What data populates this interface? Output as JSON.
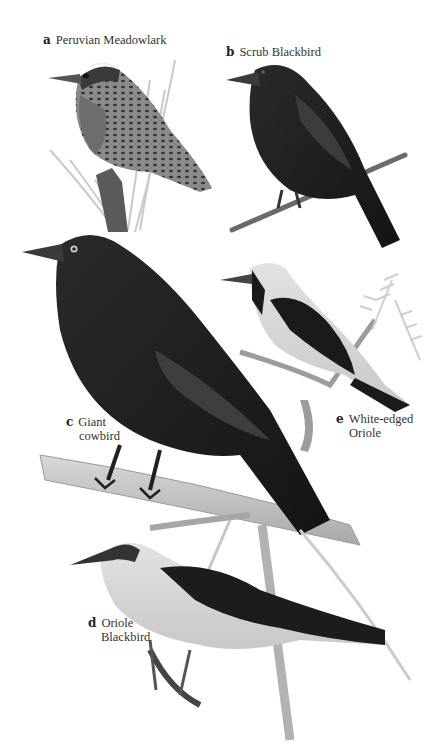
{
  "plate": {
    "species": [
      {
        "letter": "a",
        "name": "Peruvian Meadowlark",
        "line1": "Peruvian Meadowlark",
        "line2": ""
      },
      {
        "letter": "b",
        "name": "Scrub Blackbird",
        "line1": "Scrub Blackbird",
        "line2": ""
      },
      {
        "letter": "c",
        "name": "Giant cowbird",
        "line1": "Giant",
        "line2": "cowbird"
      },
      {
        "letter": "d",
        "name": "Oriole Blackbird",
        "line1": "Oriole",
        "line2": "Blackbird"
      },
      {
        "letter": "e",
        "name": "White-edged Oriole",
        "line1": "White-edged",
        "line2": "Oriole"
      }
    ]
  }
}
